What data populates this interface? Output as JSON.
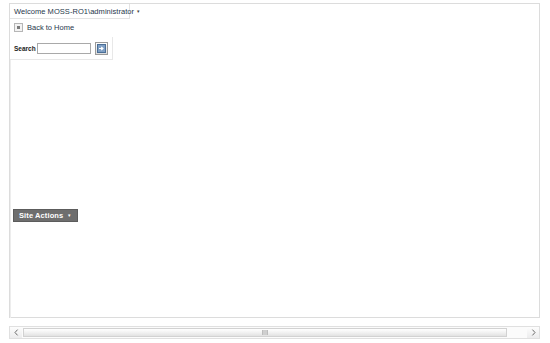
{
  "page": {
    "background_color": "#ffffff",
    "frame_border_color": "#dcdcdc"
  },
  "welcome_bar": {
    "text": "Welcome MOSS-RO1\\administrator",
    "caret": "▾",
    "link_color": "#26374c"
  },
  "back_to_home": {
    "label": "Back to Home",
    "icon": "small-square-icon"
  },
  "search": {
    "label": "Search",
    "value": "",
    "placeholder": "",
    "go_button_icon": "arrow-right-go-icon",
    "go_button_title": "Go"
  },
  "site_actions": {
    "label": "Site Actions",
    "caret": "▾",
    "background_color": "#6e6e6e",
    "text_color": "#ffffff"
  },
  "scrollbar": {
    "left_arrow_icon": "chevron-left-icon",
    "right_arrow_icon": "chevron-right-icon",
    "orientation": "horizontal",
    "thumb_grip_icon": "grip-icon"
  }
}
